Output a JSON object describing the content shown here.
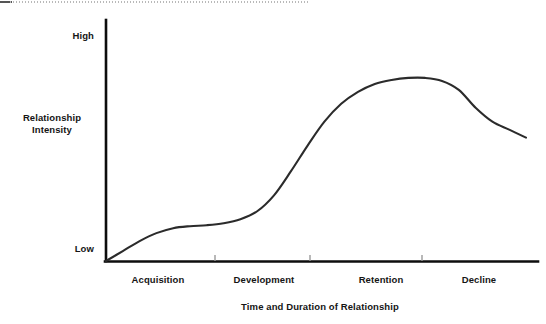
{
  "figure": {
    "width": 546,
    "height": 324,
    "background": "#ffffff",
    "line_color": "#2b2b2b",
    "axis_color": "#0d0d0d",
    "text_color": "#151515",
    "top_rule_color": "#b9b9b9"
  },
  "chart_data": {
    "type": "line",
    "title": "",
    "subtitle": "",
    "xlabel": "Time and Duration of Relationship",
    "ylabel": "Relationship Intensity",
    "ylabel_lines": [
      "Relationship",
      "Intensity"
    ],
    "grid": false,
    "legend": null,
    "legend_position": "none",
    "xlim": [
      0,
      100
    ],
    "ylim": [
      0,
      100
    ],
    "y_tick_labels": [
      "High",
      "Low"
    ],
    "y_ticks": [
      100,
      0
    ],
    "x_tick_labels": [
      "Acquisition",
      "Development",
      "Retention",
      "Decline"
    ],
    "x_category_centers": [
      12,
      36,
      63,
      86
    ],
    "x_tick_marks": [
      25,
      47,
      73
    ],
    "annotations": [],
    "series": [
      {
        "name": "Relationship Intensity",
        "x": [
          0,
          4,
          8,
          12,
          16,
          20,
          24,
          28,
          32,
          36,
          40,
          44,
          48,
          52,
          56,
          60,
          64,
          68,
          72,
          76,
          80,
          84,
          88,
          92,
          96,
          100
        ],
        "values": [
          0,
          5,
          10,
          14,
          16.5,
          17.5,
          18,
          19,
          21,
          25,
          33,
          45,
          58,
          70,
          79,
          85,
          89,
          91,
          92,
          92,
          90.5,
          86,
          77,
          70,
          66,
          62
        ]
      }
    ]
  },
  "labels": {
    "y_high": "High",
    "y_low": "Low",
    "y_title_line1": "Relationship",
    "y_title_line2": "Intensity",
    "x_acquisition": "Acquisition",
    "x_development": "Development",
    "x_retention": "Retention",
    "x_decline": "Decline",
    "x_axis_title": "Time and Duration of Relationship"
  }
}
